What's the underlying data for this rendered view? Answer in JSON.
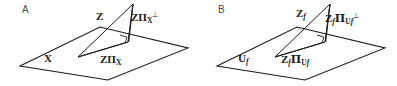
{
  "figure": {
    "width": 397,
    "height": 86,
    "background": "#ffffff",
    "line_color": "#1a1a1a",
    "label_color": "#1a1a1a",
    "panel_letter_color": "#4a4a4a"
  },
  "panels": [
    {
      "letter": "A",
      "plane_label": "X",
      "vector_label": "Z",
      "perp_component_label_base": "ZΠ",
      "perp_component_label_sub": "X",
      "perp_component_label_sup": "⊥",
      "proj_component_label_base": "ZΠ",
      "proj_component_label_sub": "X"
    },
    {
      "letter": "B",
      "plane_label_base": "U",
      "plane_label_sub": "f",
      "vector_label_base": "Z",
      "vector_label_sub": "f",
      "perp_component_label_base": "Z",
      "perp_component_label_base_sub": "f",
      "perp_component_label_pi": "Π",
      "perp_component_label_sub": "U",
      "perp_component_label_subsub": "f",
      "perp_component_label_sup": "⊥",
      "proj_component_label_base": "Z",
      "proj_component_label_base_sub": "f",
      "proj_component_label_pi": "Π",
      "proj_component_label_sub": "U",
      "proj_component_label_subsub": "f"
    }
  ],
  "geometry": {
    "panel_a": {
      "plane_points": "20,66 100,27 188,48 108,80",
      "apex": [
        133,
        4
      ],
      "foot": [
        128,
        42
      ],
      "base_left": [
        78,
        57
      ],
      "right_angle_marker": "120,35 128,37 126,43"
    },
    "panel_b": {
      "plane_points": "217,66 297,27 385,48 305,80",
      "apex": [
        330,
        4
      ],
      "foot": [
        325,
        42
      ],
      "base_left": [
        275,
        57
      ],
      "right_angle_marker": "317,35 325,37 323,43"
    }
  }
}
